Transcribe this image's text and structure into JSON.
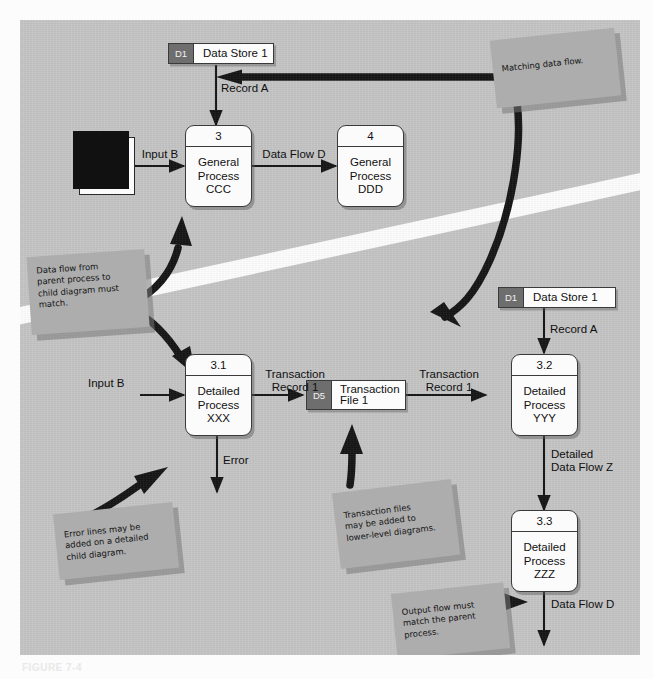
{
  "figure": {
    "caption": "FIGURE 7-4"
  },
  "palette": {
    "panel_bg": "#c4c4c4",
    "note_bg": "#adadad",
    "store_tag": "#6e6e6e",
    "box_fill": "#fbfbfb",
    "line": "#141414",
    "band": "#fdfdfd"
  },
  "parent_diagram": {
    "data_store_top": {
      "tag": "D1",
      "name": "Data Store 1"
    },
    "entity": {
      "line1": "Entity",
      "line2": "2"
    },
    "process_3": {
      "number": "3",
      "line1": "General",
      "line2": "Process",
      "line3": "CCC"
    },
    "process_4": {
      "number": "4",
      "line1": "General",
      "line2": "Process",
      "line3": "DDD"
    },
    "flows": {
      "record_a": "Record A",
      "input_b": "Input B",
      "data_flow_d": "Data Flow D"
    }
  },
  "child_diagram": {
    "data_store_right": {
      "tag": "D1",
      "name": "Data Store 1"
    },
    "transaction_file": {
      "tag": "D5",
      "name": "Transaction\nFile 1"
    },
    "process_31": {
      "number": "3.1",
      "line1": "Detailed",
      "line2": "Process",
      "line3": "XXX"
    },
    "process_32": {
      "number": "3.2",
      "line1": "Detailed",
      "line2": "Process",
      "line3": "YYY"
    },
    "process_33": {
      "number": "3.3",
      "line1": "Detailed",
      "line2": "Process",
      "line3": "ZZZ"
    },
    "flows": {
      "input_b": "Input B",
      "transaction_record_1a": "Transaction\nRecord 1",
      "transaction_record_1b": "Transaction\nRecord 1",
      "record_a": "Record A",
      "error": "Error",
      "detailed_data_flow_z": "Detailed\nData Flow Z",
      "data_flow_d": "Data Flow D"
    }
  },
  "notes": {
    "matching": "Matching data flow.",
    "parent_child": "Data flow from\nparent process to\nchild diagram must\n   match.",
    "error_lines": "Error lines may be\nadded on a detailed\nchild diagram.",
    "transaction_files": "Transaction files\nmay be added to\nlower-level diagrams.",
    "output_flow": "Output flow must\nmatch the parent\nprocess."
  }
}
